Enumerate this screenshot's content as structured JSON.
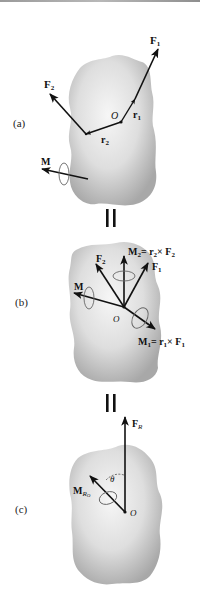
{
  "figure": {
    "parts": [
      {
        "id": "a",
        "label": "(a)",
        "point": "O",
        "vectors": [
          {
            "name": "F1",
            "text": "F",
            "sub": "1"
          },
          {
            "name": "F2",
            "text": "F",
            "sub": "2"
          },
          {
            "name": "r1",
            "text": "r",
            "sub": "1"
          },
          {
            "name": "r2",
            "text": "r",
            "sub": "2"
          },
          {
            "name": "M",
            "text": "M",
            "sub": ""
          }
        ]
      },
      {
        "id": "b",
        "label": "(b)",
        "point": "O",
        "vectors": [
          {
            "name": "F1",
            "text": "F",
            "sub": "1"
          },
          {
            "name": "F2",
            "text": "F",
            "sub": "2"
          },
          {
            "name": "M",
            "text": "M",
            "sub": ""
          },
          {
            "name": "M2",
            "text": "M",
            "sub": "2",
            "eq": "= r",
            "eq_sub": "2",
            "cross": "× F",
            "cross_sub": "2"
          },
          {
            "name": "M1",
            "text": "M",
            "sub": "1",
            "eq": "= r",
            "eq_sub": "1",
            "cross": "× F",
            "cross_sub": "1"
          }
        ]
      },
      {
        "id": "c",
        "label": "(c)",
        "point": "O",
        "angle": "θ",
        "vectors": [
          {
            "name": "FR",
            "text": "F",
            "sub": "R"
          },
          {
            "name": "MRO",
            "text": "M",
            "sub": "R",
            "subsub": "O"
          }
        ]
      }
    ],
    "equals_symbol": "||",
    "colors": {
      "body_light": "#f2f2f2",
      "body_dark": "#a9a9a9",
      "vector": "#111111",
      "line": "#9a9a9a"
    }
  }
}
